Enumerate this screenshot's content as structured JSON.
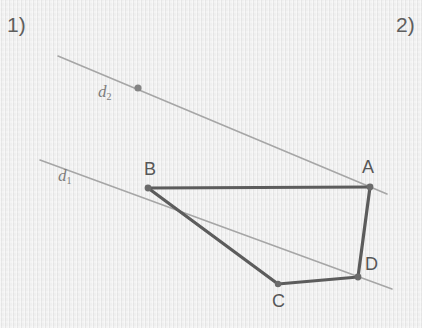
{
  "page": {
    "background_color": "#ebebeb",
    "width": 422,
    "height": 328
  },
  "exercises": {
    "first": "1)",
    "second": "2)"
  },
  "figure": {
    "stroke_colors": {
      "shape_edge": "#5c5c5c",
      "construction_line": "#a6a6a6",
      "vertex_dot": "#6b6b6b",
      "line_dot": "#858585"
    },
    "shape": {
      "name": "quadrilateral-abdc",
      "vertices": [
        {
          "id": "A",
          "label": "A",
          "x": 370,
          "y": 187
        },
        {
          "id": "B",
          "label": "B",
          "x": 148,
          "y": 188
        },
        {
          "id": "C",
          "label": "C",
          "x": 278,
          "y": 284
        },
        {
          "id": "D",
          "label": "D",
          "x": 358,
          "y": 277
        }
      ],
      "edges": [
        {
          "from": "B",
          "to": "A"
        },
        {
          "from": "A",
          "to": "D"
        },
        {
          "from": "D",
          "to": "C"
        },
        {
          "from": "C",
          "to": "B"
        }
      ]
    },
    "lines": [
      {
        "id": "d1",
        "label": "d",
        "subscript": "1",
        "x1": 40,
        "y1": 160,
        "x2": 392,
        "y2": 289,
        "label_x": 58,
        "label_y": 167
      },
      {
        "id": "d2",
        "label": "d",
        "subscript": "2",
        "x1": 58,
        "y1": 56,
        "x2": 387,
        "y2": 194,
        "label_x": 98,
        "label_y": 83,
        "marker": {
          "x": 138,
          "y": 88
        }
      }
    ],
    "vertex_labels": [
      {
        "id": "A",
        "text": "A",
        "x": 362,
        "y": 158
      },
      {
        "id": "B",
        "text": "B",
        "x": 144,
        "y": 160
      },
      {
        "id": "C",
        "text": "C",
        "x": 272,
        "y": 292
      },
      {
        "id": "D",
        "text": "D",
        "x": 365,
        "y": 255
      }
    ]
  }
}
